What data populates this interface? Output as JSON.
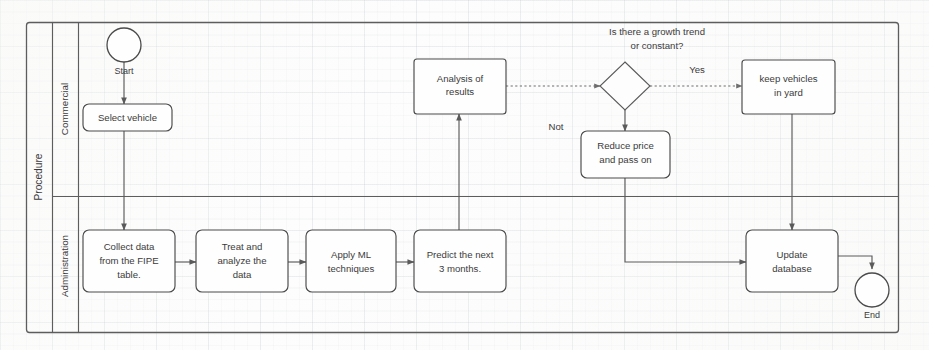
{
  "diagram": {
    "type": "bpmn-flowchart",
    "pool": {
      "label": "Procedure"
    },
    "lanes": [
      {
        "id": "commercial",
        "label": "Commercial"
      },
      {
        "id": "administration",
        "label": "Administration"
      }
    ],
    "events": [
      {
        "id": "start",
        "kind": "start-event",
        "label": "Start",
        "lane": "commercial"
      },
      {
        "id": "end",
        "kind": "end-event",
        "label": "End",
        "lane": "administration"
      }
    ],
    "gateway": {
      "id": "growth-gateway",
      "kind": "exclusive-gateway",
      "question_line1": "Is there a growth trend",
      "question_line2": "or constant?"
    },
    "tasks": [
      {
        "id": "select-vehicle",
        "lane": "commercial",
        "lines": [
          "Select vehicle"
        ]
      },
      {
        "id": "analysis-of-results",
        "lane": "commercial",
        "lines": [
          "Analysis of",
          "results"
        ]
      },
      {
        "id": "keep-vehicles-in-yard",
        "lane": "commercial",
        "lines": [
          "keep vehicles",
          "in yard"
        ]
      },
      {
        "id": "reduce-price-and-pass-on",
        "lane": "commercial",
        "lines": [
          "Reduce price",
          "and pass on"
        ]
      },
      {
        "id": "collect-data-fipe",
        "lane": "administration",
        "lines": [
          "Collect data",
          "from the FIPE",
          "table."
        ]
      },
      {
        "id": "treat-analyze-data",
        "lane": "administration",
        "lines": [
          "Treat and",
          "analyze the",
          "data"
        ]
      },
      {
        "id": "apply-ml-techniques",
        "lane": "administration",
        "lines": [
          "Apply ML",
          "techniques"
        ]
      },
      {
        "id": "predict-next-3-months",
        "lane": "administration",
        "lines": [
          "Predict the next",
          "3 months."
        ]
      },
      {
        "id": "update-database",
        "lane": "administration",
        "lines": [
          "Update",
          "database"
        ]
      }
    ],
    "flow_labels": [
      {
        "id": "yes-label",
        "text": "Yes"
      },
      {
        "id": "not-label",
        "text": "Not"
      }
    ],
    "colors": {
      "line": "#5a5a5a",
      "frame": "#5d5d5d",
      "text": "#3b3b3b",
      "shape_fill": "#fefefe",
      "background": "#fdfdfd"
    }
  }
}
